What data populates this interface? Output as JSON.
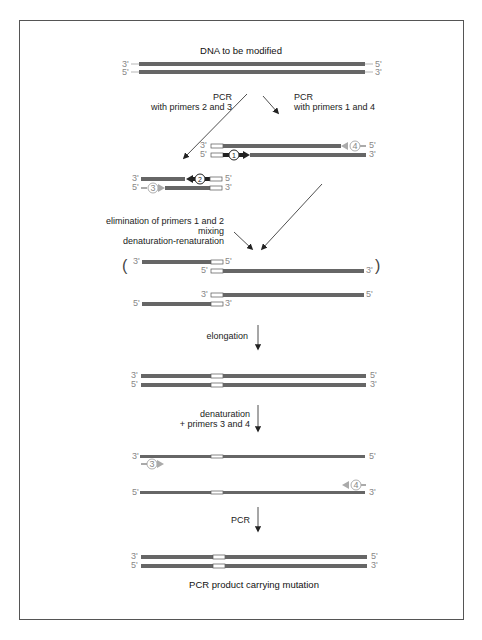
{
  "figure": {
    "title": "DNA to be modified",
    "footer": "PCR product carrying mutation",
    "colors": {
      "strand": "#666666",
      "mutation": "#ffffff",
      "primer_dark": "#222222",
      "primer_light": "#aaaaaa",
      "frame": "#555555"
    }
  },
  "steps": {
    "pcr_left_1": "PCR",
    "pcr_left_2": "with primers 2 and 3",
    "pcr_right_1": "PCR",
    "pcr_right_2": "with primers 1 and 4",
    "elim_1": "elimination of primers 1 and 2",
    "elim_2": "mixing",
    "elim_3": "denaturation-renaturation",
    "elongation": "elongation",
    "denat_1": "denaturation",
    "denat_2": "+ primers 3 and 4",
    "pcr_final": "PCR"
  },
  "ends": {
    "three": "3'",
    "five": "5'"
  },
  "primers": {
    "p1": "1",
    "p2": "2",
    "p3": "3",
    "p4": "4"
  },
  "brackets": {
    "open": "(",
    "close": ")"
  }
}
